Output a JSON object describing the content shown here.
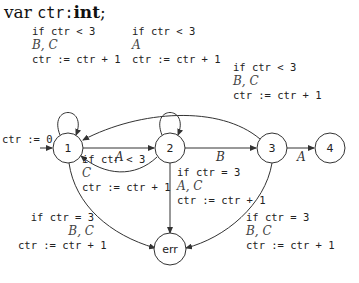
{
  "declaration": {
    "keyword": "var",
    "variable": "ctr",
    "sep": ":",
    "type": "int",
    "end": ";"
  },
  "states": [
    {
      "id": "1",
      "label": "1"
    },
    {
      "id": "2",
      "label": "2"
    },
    {
      "id": "3",
      "label": "3"
    },
    {
      "id": "4",
      "label": "4"
    },
    {
      "id": "err",
      "label": "err"
    }
  ],
  "initial": {
    "label": "ctr := 0"
  },
  "edges": {
    "self1": {
      "cond": "if ctr < 3",
      "events": "B, C",
      "action": "ctr := ctr + 1"
    },
    "self2": {
      "cond": "if ctr < 3",
      "events": "A",
      "action": "ctr := ctr + 1"
    },
    "e3to1": {
      "cond": "if ctr < 3",
      "events": "B, C",
      "action": "ctr := ctr + 1"
    },
    "e1to2": {
      "label": "A"
    },
    "e2to3": {
      "label": "B"
    },
    "e3to4": {
      "label": "A"
    },
    "e2to1": {
      "cond": "if ctr < 3",
      "events": "C",
      "action": "ctr := ctr + 1"
    },
    "e2toErr": {
      "cond": "if ctr = 3",
      "events": "A, C",
      "action": "ctr := ctr + 1"
    },
    "e1toErr": {
      "cond": "if ctr = 3",
      "events": "B, C",
      "action": "ctr := ctr + 1"
    },
    "e3toErr": {
      "cond": "if ctr = 3",
      "events": "B, C",
      "action": "ctr := ctr + 1"
    }
  }
}
